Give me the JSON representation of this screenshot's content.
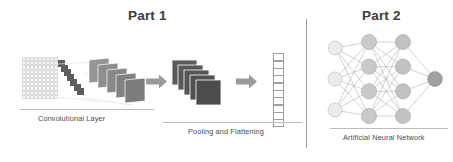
{
  "figure": {
    "kind": "cnn-architecture-diagram",
    "background_color": "#ffffff"
  },
  "titles": {
    "part1": "Part 1",
    "part2": "Part 2"
  },
  "captions": {
    "convolutional_layer": "Convolutional Layer",
    "pooling_and_flattening": "Pooling and Flattening",
    "artificial_neural_network": "Artificial Neural Network"
  },
  "stages": [
    {
      "name": "input-image-grid",
      "columns": 9,
      "rows": 10,
      "cell_fill": "#f7f7f7",
      "cell_border": "#dedede"
    },
    {
      "name": "convolution-filter",
      "shape": "diagonal-staircase",
      "blocks": 7,
      "color": "#5d5d5d"
    },
    {
      "name": "feature-map-stack",
      "count": 5,
      "colors": [
        "#8e8e8e",
        "#898989",
        "#848484",
        "#7f7f7f",
        "#7a7a7a"
      ]
    },
    {
      "name": "pooling-stack",
      "count": 5,
      "color": "#5a5a5a"
    },
    {
      "name": "flattened-vector",
      "cells": 10,
      "cell_fill": "#ffffff",
      "cell_border": "#9f9f9f"
    }
  ],
  "arrows": [
    {
      "name": "arrow-conv-to-pool",
      "color": "#9a9a9a",
      "direction": "right"
    },
    {
      "name": "arrow-pool-to-flatten",
      "color": "#9a9a9a",
      "direction": "right"
    }
  ],
  "divider": {
    "name": "part-divider",
    "color": "#9a9a9a",
    "orientation": "vertical"
  },
  "neural_network": {
    "layers": [
      {
        "name": "input-layer",
        "nodes": 3,
        "fill": "#ebebeb",
        "stroke": "#b9b9b9"
      },
      {
        "name": "hidden-layer-1",
        "nodes": 4,
        "fill": "#c9c9c9",
        "stroke": "#a8a8a8"
      },
      {
        "name": "hidden-layer-2",
        "nodes": 4,
        "fill": "#c2c2c2",
        "stroke": "#a8a8a8"
      },
      {
        "name": "output-layer",
        "nodes": 1,
        "fill": "#a0a0a0",
        "stroke": "#8b8b8b"
      }
    ],
    "edge_color": "#9c9c9c",
    "fully_connected": true
  },
  "colors": {
    "title_text": "#3b3b3b",
    "caption_text": "#4a4a4a",
    "rule": "#bdbdbd",
    "arrow": "#9a9a9a"
  }
}
